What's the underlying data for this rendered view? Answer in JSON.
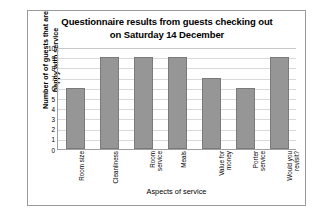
{
  "chart_data": {
    "type": "bar",
    "title": "Questionnaire results from guests checking out on Saturday 14 December",
    "title_lines": [
      "Questionnaire results from guests checking out",
      "on Saturday 14 December"
    ],
    "categories": [
      "Room size",
      "Cleanliness",
      "Room service",
      "Meals",
      "Value for money",
      "Porter service",
      "Would you revisit?"
    ],
    "category_lines": [
      [
        "Room size"
      ],
      [
        "Cleanliness"
      ],
      [
        "Room",
        "service"
      ],
      [
        "Meals"
      ],
      [
        "Value for",
        "money"
      ],
      [
        "Porter",
        "service"
      ],
      [
        "Would you",
        "revisit?"
      ]
    ],
    "values": [
      6,
      9,
      9,
      9,
      7,
      6,
      9
    ],
    "xlabel": "Aspects of service",
    "ylabel": "Number of of guests that are happy with service",
    "ylabel_lines": [
      "Number of of guests that are",
      "happy with service"
    ],
    "ylim": [
      0,
      10
    ],
    "ytick_labels": [
      "10",
      "9",
      "8",
      "7",
      "6",
      "5",
      "4",
      "3",
      "2",
      "1",
      "0"
    ],
    "ytick_values": [
      10,
      9,
      8,
      7,
      6,
      5,
      4,
      3,
      2,
      1,
      0
    ],
    "grid": true,
    "legend": false,
    "bar_color": "#969696",
    "bar_border_color": "#7a7a7a",
    "gridline_color": "#d9d9d9",
    "axis_color": "#a0a0a0",
    "frame_color": "#9a9a9a",
    "background": "#ffffff"
  }
}
